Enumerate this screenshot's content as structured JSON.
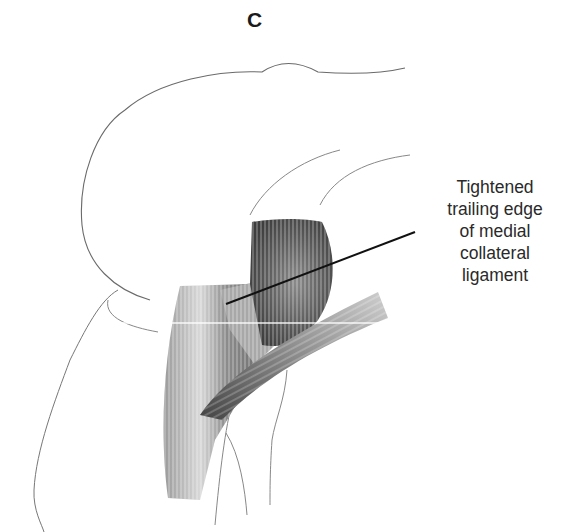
{
  "figure": {
    "panel_label": "C",
    "callout": {
      "lines": [
        "Tightened",
        "trailing edge",
        "of medial",
        "collateral",
        "ligament"
      ]
    },
    "colors": {
      "background": "#ffffff",
      "outline": "#555555",
      "leader_line": "#111111",
      "text": "#2a2a2a"
    }
  }
}
